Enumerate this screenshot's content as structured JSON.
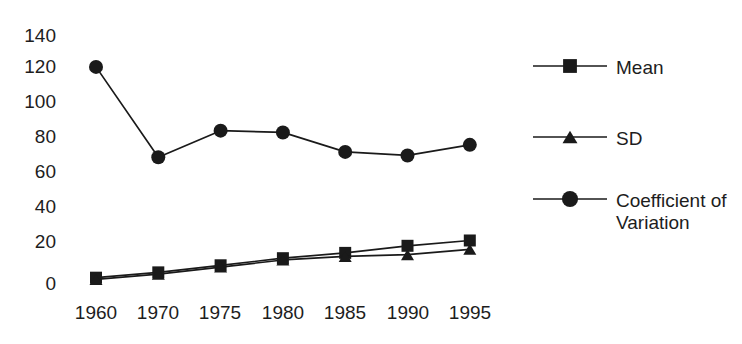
{
  "chart_data": {
    "type": "line",
    "title": "",
    "subtitle": "",
    "xlabel": "",
    "ylabel": "",
    "categories": [
      "1960",
      "1970",
      "1975",
      "1980",
      "1985",
      "1990",
      "1995"
    ],
    "ylim": [
      0,
      140
    ],
    "y_ticks": [
      "0",
      "20",
      "40",
      "60",
      "80",
      "100",
      "120",
      "140"
    ],
    "y_tick_values": [
      0,
      20,
      40,
      60,
      80,
      100,
      120,
      140
    ],
    "grid": false,
    "legend_position": "right",
    "series": [
      {
        "name": "Mean",
        "marker": "square",
        "color": "#1a1a1a",
        "values": [
          3,
          6,
          10,
          14,
          17,
          21,
          24
        ]
      },
      {
        "name": "SD",
        "marker": "triangle",
        "color": "#1a1a1a",
        "values": [
          2,
          5,
          9,
          13,
          15,
          16,
          19
        ]
      },
      {
        "name": "Coefficient of Variation",
        "marker": "circle",
        "color": "#1a1a1a",
        "values": [
          122,
          71,
          86,
          85,
          74,
          72,
          78
        ]
      }
    ]
  },
  "legend": {
    "entries": [
      {
        "label": "Mean",
        "marker": "square"
      },
      {
        "label": "SD",
        "marker": "triangle"
      },
      {
        "label": "Coefficient of\nVariation",
        "marker": "circle"
      }
    ]
  },
  "axes": {
    "y_labels": [
      "140",
      "120",
      "100",
      "80",
      "60",
      "40",
      "20",
      "0"
    ],
    "x_labels": [
      "1960",
      "1970",
      "1975",
      "1980",
      "1985",
      "1990",
      "1995"
    ]
  }
}
